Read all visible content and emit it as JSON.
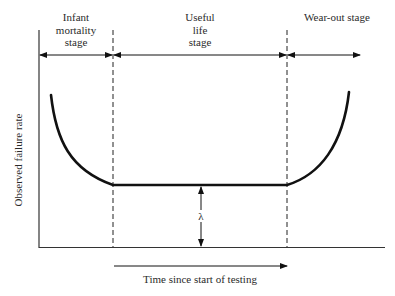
{
  "diagram": {
    "type": "bathtub-curve",
    "stages": [
      {
        "id": "infant",
        "label_lines": [
          "Infant",
          "mortality",
          "stage"
        ]
      },
      {
        "id": "useful",
        "label_lines": [
          "Useful",
          "life",
          "stage"
        ]
      },
      {
        "id": "wearout",
        "label_lines": [
          "Wear-out stage"
        ]
      }
    ],
    "y_axis_label": "Observed failure rate",
    "x_axis_label": "Time since start of testing",
    "lambda_symbol": "λ",
    "colors": {
      "line": "#111111",
      "text": "#2a2a2a",
      "background": "#ffffff"
    }
  }
}
